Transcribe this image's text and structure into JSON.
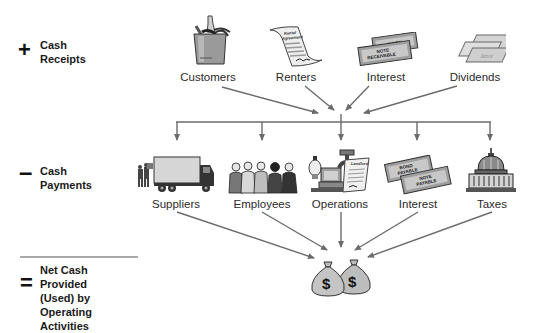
{
  "sections": {
    "receipts": {
      "symbol": "+",
      "label_line1": "Cash",
      "label_line2": "Receipts"
    },
    "payments": {
      "symbol": "–",
      "label_line1": "Cash",
      "label_line2": "Payments"
    },
    "net": {
      "symbol": "=",
      "label_line1": "Net Cash Provided",
      "label_line2": "(Used) by Operating",
      "label_line3": "Activities"
    }
  },
  "receipts_items": [
    {
      "label": "Customers",
      "icon": "shopping-bag-icon"
    },
    {
      "label": "Renters",
      "icon": "rental-agreement-icon",
      "icon_text": "Rental Agreement"
    },
    {
      "label": "Interest",
      "icon": "notes-receivable-icon",
      "icon_text_back": "NOTE",
      "icon_text_front": "NOTE RECEIVABLE"
    },
    {
      "label": "Dividends",
      "icon": "stock-certificates-icon",
      "icon_text": "Stock"
    }
  ],
  "payments_items": [
    {
      "label": "Suppliers",
      "icon": "delivery-truck-icon"
    },
    {
      "label": "Employees",
      "icon": "employees-group-icon"
    },
    {
      "label": "Operations",
      "icon": "operations-utilities-icon",
      "icon_text": "Landlord"
    },
    {
      "label": "Interest",
      "icon": "notes-payable-icon",
      "icon_text_back": "BOND PAYABLE",
      "icon_text_front": "NOTE PAYABLE"
    },
    {
      "label": "Taxes",
      "icon": "capitol-building-icon"
    }
  ],
  "result": {
    "icon": "money-bags-icon",
    "symbol": "$"
  },
  "colors": {
    "arrow": "#6b6b6b",
    "text": "#2a2a2a",
    "icon_fill": "#bdbdbd",
    "icon_stroke": "#333333"
  }
}
